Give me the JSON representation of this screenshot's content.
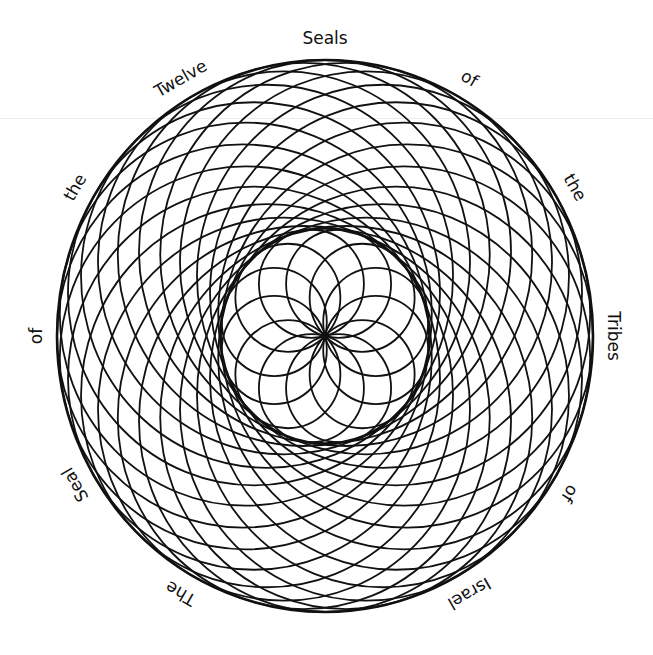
{
  "figure": {
    "title_words": [
      {
        "text": "Seals",
        "angle": 0
      },
      {
        "text": "of",
        "angle": 30
      },
      {
        "text": "the",
        "angle": 60
      },
      {
        "text": "Tribes",
        "angle": 90
      },
      {
        "text": "of",
        "angle": 122
      },
      {
        "text": "Israel",
        "angle": 150
      },
      {
        "text": "The",
        "angle": 210
      },
      {
        "text": "Seal",
        "angle": 240
      },
      {
        "text": "of",
        "angle": 270
      },
      {
        "text": "the",
        "angle": 300
      },
      {
        "text": "Twelve",
        "angle": 330
      }
    ],
    "full_text": "The Seal of the Twelve Seals of the Tribes of Israel",
    "geometry": {
      "cx": 325,
      "cy": 336,
      "rx": 268,
      "ry": 276,
      "outer_circle_count": 24,
      "inner_petal_count": 12,
      "inner_ring_radius": 105
    },
    "colors": {
      "line": "#111111",
      "background": "#ffffff"
    }
  }
}
